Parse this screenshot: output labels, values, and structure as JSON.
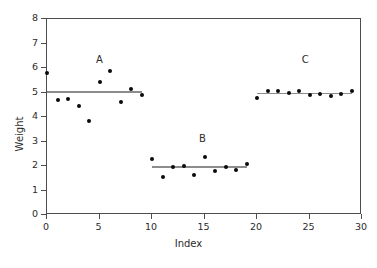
{
  "chart_data": {
    "type": "scatter",
    "title": "",
    "xlabel": "Index",
    "ylabel": "Weight",
    "xlim": [
      0,
      30
    ],
    "ylim": [
      0,
      8
    ],
    "xticks": [
      0,
      5,
      10,
      15,
      20,
      25,
      30
    ],
    "yticks": [
      0,
      1,
      2,
      3,
      4,
      5,
      6,
      7,
      8
    ],
    "grid": false,
    "legend": "none",
    "marker_color": "#0a0a0a",
    "meanline_color": "#8c8c8c",
    "x": [
      0,
      1,
      2,
      3,
      4,
      5,
      6,
      7,
      8,
      9,
      10,
      11,
      12,
      13,
      14,
      15,
      16,
      17,
      18,
      19,
      20,
      21,
      22,
      23,
      24,
      25,
      26,
      27,
      28,
      29
    ],
    "y": [
      5.8,
      4.7,
      4.75,
      4.45,
      3.85,
      5.42,
      5.88,
      4.63,
      5.15,
      4.88,
      2.3,
      1.55,
      1.95,
      2.0,
      1.65,
      2.35,
      1.8,
      1.95,
      1.85,
      2.1,
      4.78,
      5.05,
      5.08,
      5.0,
      5.08,
      4.88,
      4.92,
      4.85,
      4.95,
      5.05
    ],
    "groups": [
      {
        "name": "A",
        "label_x": 5.0,
        "label_y": 6.55,
        "x_start": 0,
        "x_end": 9,
        "mean": 5.01,
        "x": [
          0,
          1,
          2,
          3,
          4,
          5,
          6,
          7,
          8,
          9
        ],
        "y": [
          5.8,
          4.7,
          4.75,
          4.45,
          3.85,
          5.42,
          5.88,
          4.63,
          5.15,
          4.88
        ]
      },
      {
        "name": "B",
        "label_x": 14.8,
        "label_y": 3.3,
        "x_start": 10,
        "x_end": 19,
        "mean": 1.95,
        "x": [
          10,
          11,
          12,
          13,
          14,
          15,
          16,
          17,
          18,
          19
        ],
        "y": [
          2.3,
          1.55,
          1.95,
          2.0,
          1.65,
          2.35,
          1.8,
          1.95,
          1.85,
          2.1
        ]
      },
      {
        "name": "C",
        "label_x": 24.6,
        "label_y": 6.55,
        "x_start": 20,
        "x_end": 29,
        "mean": 4.96,
        "x": [
          20,
          21,
          22,
          23,
          24,
          25,
          26,
          27,
          28,
          29
        ],
        "y": [
          4.78,
          5.05,
          5.08,
          5.0,
          5.08,
          4.88,
          4.92,
          4.85,
          4.95,
          5.05
        ]
      }
    ]
  }
}
